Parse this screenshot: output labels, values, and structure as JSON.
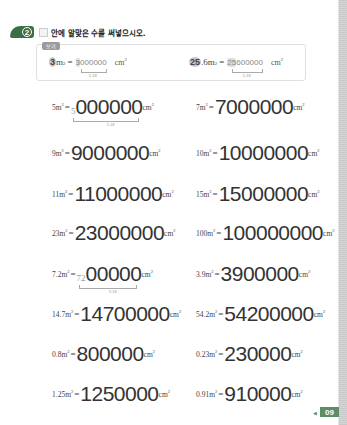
{
  "header": {
    "problem_number": "2",
    "instruction": "안에 알맞은 수를 써넣으시오."
  },
  "example": {
    "tag": "보기",
    "items": [
      {
        "lhs_value": "3",
        "lhs_unit": "m",
        "lhs_exp": "2",
        "eq": "=",
        "answer_first": "3",
        "answer_rest": "000000",
        "unit": "cm",
        "unit_exp": "2",
        "hint": "5.18"
      },
      {
        "lhs_value": "25",
        "lhs_suffix": ".6",
        "lhs_unit": "m",
        "lhs_exp": "2",
        "eq": "=",
        "answer_first": "25",
        "answer_rest": "600000",
        "unit": "cm",
        "unit_exp": "2",
        "hint": "5.18"
      }
    ]
  },
  "problems": [
    {
      "lhs": "5m",
      "exp": "2",
      "eq": "=",
      "prefix": "5",
      "answer": "000000",
      "unit": "cm",
      "uexp": "2",
      "hint": "5.18"
    },
    {
      "lhs": "7m",
      "exp": "2",
      "eq": "=",
      "answer": "7000000",
      "unit": "cm",
      "uexp": "2"
    },
    {
      "lhs": "9m",
      "exp": "2",
      "eq": "=",
      "answer": "9000000",
      "unit": "cm",
      "uexp": "2"
    },
    {
      "lhs": "10m",
      "exp": "2",
      "eq": "=",
      "answer": "10000000",
      "unit": "cm",
      "uexp": "2"
    },
    {
      "lhs": "11m",
      "exp": "2",
      "eq": "=",
      "answer": "11000000",
      "unit": "cm",
      "uexp": "2"
    },
    {
      "lhs": "15m",
      "exp": "2",
      "eq": "=",
      "answer": "15000000",
      "unit": "cm",
      "uexp": "2"
    },
    {
      "lhs": "23m",
      "exp": "2",
      "eq": "=",
      "answer": "23000000",
      "unit": "cm",
      "uexp": "2"
    },
    {
      "lhs": "100m",
      "exp": "2",
      "eq": "=",
      "answer": "100000000",
      "unit": "cm",
      "uexp": "2"
    },
    {
      "lhs": "7.2m",
      "exp": "2",
      "eq": "=",
      "prefix": "72",
      "answer": "00000",
      "unit": "cm",
      "uexp": "2",
      "hint": "5.18"
    },
    {
      "lhs": "3.9m",
      "exp": "2",
      "eq": "=",
      "answer": "3900000",
      "unit": "cm",
      "uexp": "2"
    },
    {
      "lhs": "14.7m",
      "exp": "2",
      "eq": "=",
      "answer": "14700000",
      "unit": "cm",
      "uexp": "2"
    },
    {
      "lhs": "54.2m",
      "exp": "2",
      "eq": "=",
      "answer": "54200000",
      "unit": "cm",
      "uexp": "2"
    },
    {
      "lhs": "0.8m",
      "exp": "2",
      "eq": "=",
      "answer": "800000",
      "unit": "cm",
      "uexp": "2"
    },
    {
      "lhs": "0.23m",
      "exp": "2",
      "eq": "=",
      "answer": "230000",
      "unit": "cm",
      "uexp": "2"
    },
    {
      "lhs": "1.25m",
      "exp": "2",
      "eq": "=",
      "answer": "1250000",
      "unit": "cm",
      "uexp": "2"
    },
    {
      "lhs": "0.91m",
      "exp": "2",
      "eq": "=",
      "answer": "910000",
      "unit": "cm",
      "uexp": "2"
    }
  ],
  "footer": {
    "page_number": "09"
  }
}
